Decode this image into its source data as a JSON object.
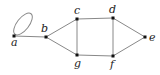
{
  "diagram": {
    "type": "undirected-graph",
    "nodes": [
      {
        "id": "a",
        "label": "a",
        "x": 14,
        "y": 36,
        "lx": 11,
        "ly": 46
      },
      {
        "id": "b",
        "label": "b",
        "x": 46,
        "y": 37,
        "lx": 41,
        "ly": 32
      },
      {
        "id": "c",
        "label": "c",
        "x": 77,
        "y": 19,
        "lx": 74,
        "ly": 14
      },
      {
        "id": "d",
        "label": "d",
        "x": 113,
        "y": 18,
        "lx": 109,
        "ly": 13
      },
      {
        "id": "e",
        "label": "e",
        "x": 145,
        "y": 37,
        "lx": 149,
        "ly": 41
      },
      {
        "id": "f",
        "label": "f",
        "x": 113,
        "y": 56,
        "lx": 110,
        "ly": 68
      },
      {
        "id": "g",
        "label": "g",
        "x": 77,
        "y": 55,
        "lx": 74,
        "ly": 67
      }
    ],
    "edges": [
      [
        "a",
        "a"
      ],
      [
        "a",
        "b"
      ],
      [
        "b",
        "c"
      ],
      [
        "b",
        "g"
      ],
      [
        "c",
        "d"
      ],
      [
        "c",
        "g"
      ],
      [
        "d",
        "f"
      ],
      [
        "d",
        "e"
      ],
      [
        "f",
        "e"
      ],
      [
        "g",
        "f"
      ]
    ],
    "colors": {
      "edge": "#888888",
      "node": "#111111",
      "label": "#222222"
    }
  }
}
